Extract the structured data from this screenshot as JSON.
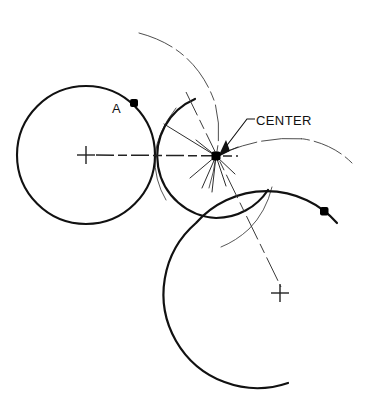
{
  "figure": {
    "type": "geometric-construction-diagram",
    "title": "",
    "background_color": "#ffffff",
    "ink_color": "#111111",
    "width": 369,
    "height": 408
  },
  "labels": {
    "center": "CENTER",
    "point_a": "A"
  },
  "colors": {
    "stroke_heavy": "#111111",
    "stroke_thin": "#444444",
    "marker_fill": "#000000"
  },
  "geometry": {
    "left_circle": {
      "name": "left-circle",
      "cx": 86,
      "cy": 155,
      "r": 69,
      "stroke_width": 2.1,
      "style": "solid"
    },
    "middle_arc": {
      "name": "middle-arc",
      "cx": 216,
      "cy": 156,
      "r": 62,
      "start_angle_deg": 110,
      "end_angle_deg": 250,
      "stroke_width": 2.1,
      "style": "solid"
    },
    "lower_right_arc": {
      "name": "lower-right-arc",
      "cx": 280,
      "cy": 293,
      "r": 94,
      "start_angle_deg": 122,
      "end_angle_deg": 385,
      "stroke_width": 2.1,
      "style": "solid"
    },
    "construction_arc_top": {
      "name": "construction-arc-top",
      "cx": 86,
      "cy": 155,
      "r": 139,
      "start_angle_deg": 250,
      "end_angle_deg": 310,
      "stroke_width": 0.9,
      "style": "dash-dot"
    },
    "construction_arc_right": {
      "name": "construction-arc-right",
      "cx": 280,
      "cy": 293,
      "r": 157,
      "start_angle_deg": 213,
      "end_angle_deg": 270,
      "stroke_width": 0.9,
      "style": "dash-dot"
    },
    "construction_arc_left_thin": {
      "name": "construction-arc-left-thin",
      "cx": 216,
      "cy": 156,
      "r": 62,
      "start_angle_deg": 142,
      "end_angle_deg": 250,
      "stroke_width": 0.8,
      "style": "solid"
    },
    "construction_arc_vertical_thin": {
      "name": "construction-arc-vertical-thin",
      "cx": 86,
      "cy": 155,
      "r": 139,
      "start_angle_deg": 285,
      "end_angle_deg": 345,
      "stroke_width": 0.8,
      "style": "solid"
    },
    "construction_arc_right_small": {
      "name": "construction-arc-right-small",
      "cx": 280,
      "cy": 293,
      "r": 121,
      "start_angle_deg": 232,
      "end_angle_deg": 292,
      "stroke_width": 0.8,
      "style": "solid"
    },
    "center_point": {
      "name": "center-point",
      "x": 216,
      "y": 156,
      "marker": "filled-square-dot",
      "size": 6
    },
    "point_a_dot": {
      "name": "point-a-dot",
      "x": 134,
      "y": 103,
      "marker": "filled-square-dot",
      "size": 6
    },
    "right_arc_dot": {
      "name": "right-arc-dot",
      "x": 324,
      "y": 211,
      "marker": "filled-square-dot",
      "size": 6
    },
    "left_center_cross": {
      "name": "left-center-cross",
      "x": 86,
      "y": 155,
      "arm": 9
    },
    "lower_center_cross": {
      "name": "lower-center-cross",
      "x": 280,
      "y": 293,
      "arm": 9
    },
    "centerline_horizontal": {
      "name": "horizontal-centerline",
      "x1": 92,
      "y1": 155,
      "x2": 240,
      "y2": 156,
      "style": "dash-dot",
      "stroke_width": 1.4
    },
    "centerline_diagonal": {
      "name": "diagonal-centerline",
      "x1": 186,
      "y1": 93,
      "x2": 281,
      "y2": 287,
      "style": "dash-dot",
      "stroke_width": 1.0
    },
    "radius_line_upper_left": {
      "name": "radius-line-upper-left",
      "x1": 216,
      "y1": 156,
      "x2": 165,
      "y2": 125,
      "stroke_width": 1.0
    },
    "radius_spokes": {
      "name": "radius-spokes",
      "origin": [
        216,
        156
      ],
      "endpoints": [
        [
          192,
          176
        ],
        [
          203,
          186
        ],
        [
          213,
          190
        ],
        [
          224,
          185
        ],
        [
          232,
          172
        ],
        [
          195,
          142
        ],
        [
          236,
          146
        ]
      ],
      "stroke_width": 0.9
    },
    "leader_line_center": {
      "name": "center-leader-line",
      "points": [
        [
          220,
          158
        ],
        [
          245,
          120
        ],
        [
          253,
          120
        ]
      ],
      "stroke_width": 1.0
    }
  },
  "text_positions": {
    "center_label": {
      "x": 254,
      "y": 125
    },
    "a_label": {
      "x": 112,
      "y": 113
    }
  }
}
